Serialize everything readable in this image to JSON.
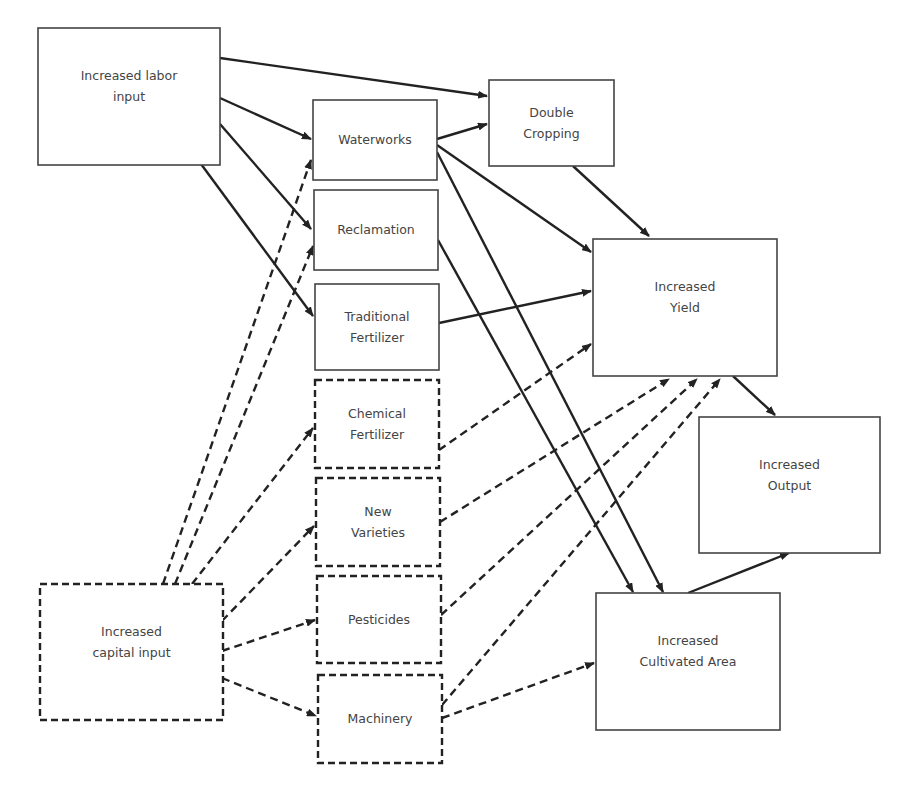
{
  "legend": {
    "solid": "labor-driven link",
    "dashed": "capital-driven link"
  },
  "nodes": [
    {
      "id": "labor",
      "lines": [
        "Increased labor",
        "input"
      ],
      "style": "solid"
    },
    {
      "id": "waterworks",
      "lines": [
        "Waterworks"
      ],
      "style": "solid"
    },
    {
      "id": "reclamation",
      "lines": [
        "Reclamation"
      ],
      "style": "solid"
    },
    {
      "id": "trad_fert",
      "lines": [
        "Traditional",
        "Fertilizer"
      ],
      "style": "solid"
    },
    {
      "id": "chem_fert",
      "lines": [
        "Chemical",
        "Fertilizer"
      ],
      "style": "dashed"
    },
    {
      "id": "new_var",
      "lines": [
        "New",
        "Varieties"
      ],
      "style": "dashed"
    },
    {
      "id": "pesticides",
      "lines": [
        "Pesticides"
      ],
      "style": "dashed"
    },
    {
      "id": "machinery",
      "lines": [
        "Machinery"
      ],
      "style": "dashed"
    },
    {
      "id": "capital",
      "lines": [
        "Increased",
        "capital input"
      ],
      "style": "dashed"
    },
    {
      "id": "double_crop",
      "lines": [
        "Double",
        "Cropping"
      ],
      "style": "solid"
    },
    {
      "id": "yield",
      "lines": [
        "Increased",
        "Yield"
      ],
      "style": "solid"
    },
    {
      "id": "output",
      "lines": [
        "Increased",
        "Output"
      ],
      "style": "solid"
    },
    {
      "id": "area",
      "lines": [
        "Increased",
        "Cultivated Area"
      ],
      "style": "solid"
    }
  ],
  "edges": [
    {
      "from": "labor",
      "to": "double_crop",
      "style": "solid"
    },
    {
      "from": "labor",
      "to": "waterworks",
      "style": "solid"
    },
    {
      "from": "labor",
      "to": "reclamation",
      "style": "solid"
    },
    {
      "from": "labor",
      "to": "trad_fert",
      "style": "solid"
    },
    {
      "from": "waterworks",
      "to": "double_crop",
      "style": "solid"
    },
    {
      "from": "waterworks",
      "to": "yield",
      "style": "solid"
    },
    {
      "from": "waterworks",
      "to": "area",
      "style": "solid"
    },
    {
      "from": "reclamation",
      "to": "area",
      "style": "solid"
    },
    {
      "from": "trad_fert",
      "to": "yield",
      "style": "solid"
    },
    {
      "from": "double_crop",
      "to": "yield",
      "style": "solid"
    },
    {
      "from": "yield",
      "to": "output",
      "style": "solid"
    },
    {
      "from": "area",
      "to": "output",
      "style": "solid"
    },
    {
      "from": "capital",
      "to": "waterworks",
      "style": "dashed"
    },
    {
      "from": "capital",
      "to": "reclamation",
      "style": "dashed"
    },
    {
      "from": "capital",
      "to": "chem_fert",
      "style": "dashed"
    },
    {
      "from": "capital",
      "to": "new_var",
      "style": "dashed"
    },
    {
      "from": "capital",
      "to": "pesticides",
      "style": "dashed"
    },
    {
      "from": "capital",
      "to": "machinery",
      "style": "dashed"
    },
    {
      "from": "chem_fert",
      "to": "yield",
      "style": "dashed"
    },
    {
      "from": "new_var",
      "to": "yield",
      "style": "dashed"
    },
    {
      "from": "pesticides",
      "to": "yield",
      "style": "dashed"
    },
    {
      "from": "machinery",
      "to": "yield",
      "style": "dashed"
    },
    {
      "from": "machinery",
      "to": "area",
      "style": "dashed"
    }
  ]
}
